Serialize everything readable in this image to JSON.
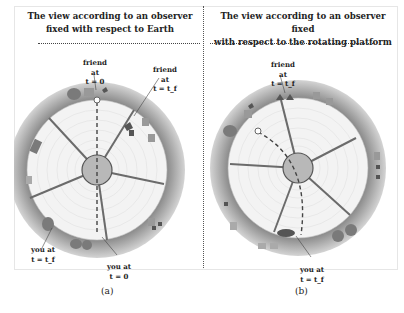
{
  "panels": [
    {
      "id": "a",
      "title_line1": "The view according to an observer",
      "title_line2": "fixed with respect to Earth",
      "caption": "(a)",
      "labels": {
        "friend_start": {
          "line1": "friend at",
          "line2": "t = 0"
        },
        "friend_end": {
          "line1": "friend at",
          "line2": "t = t_f"
        },
        "you_end": {
          "line1": "you at",
          "line2": "t = t_f"
        },
        "you_start": {
          "line1": "you at",
          "line2": "t = 0"
        }
      },
      "path_style": "straight dashed line through center"
    },
    {
      "id": "b",
      "title_line1": "The view according to an observer fixed",
      "title_line2": "with respect to the rotating platform",
      "caption": "(b)",
      "labels": {
        "friend_end": {
          "line1": "friend at",
          "line2": "t = t_f"
        },
        "you_end": {
          "line1": "you at",
          "line2": "t = t_f"
        }
      },
      "path_style": "curved dashed line"
    }
  ],
  "colors": {
    "ring": "#9a9a9a",
    "platform": "#f2f2f2",
    "spoke": "#6b6b6b",
    "hub": "#b8b8b8",
    "object": "#7d7d7d"
  }
}
